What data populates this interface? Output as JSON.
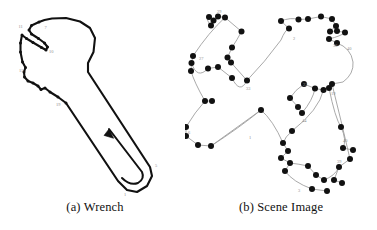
{
  "figure": {
    "background_color": "#ffffff",
    "ink_color": "#111111",
    "label_color": "#8d8d8d",
    "curve_color": "#9a9a9a",
    "panels": [
      {
        "id": "wrench",
        "caption": "(a) Wrench",
        "description": "Closed contour outline of an open-end wrench with numbered boundary feature points and a direction arrow along the handle."
      },
      {
        "id": "scene",
        "caption": "(b) Scene Image",
        "description": "Scene with many extracted interest points drawn as filled black dots linked by thin grey contour curves."
      }
    ]
  },
  "wrench": {
    "caption": "(a) Wrench",
    "outline_color": "#111111",
    "outline_width": 2.1,
    "arrow": {
      "name": "direction-arrow",
      "description": "upward arrow along inner handle edge"
    },
    "labels": [
      {
        "text": "11",
        "x": 18.5,
        "y": 27.5
      },
      {
        "text": "7",
        "x": 44.5,
        "y": 29.0
      },
      {
        "text": "10",
        "x": 49.0,
        "y": 53.0
      },
      {
        "text": "15",
        "x": 19.0,
        "y": 71.5
      },
      {
        "text": "19",
        "x": 56.0,
        "y": 106.0
      },
      {
        "text": "5",
        "x": 155.0,
        "y": 167.0
      },
      {
        "text": "1",
        "x": 124.0,
        "y": 196.0
      }
    ],
    "vertices": [
      {
        "x": 39.0,
        "y": 22.0
      },
      {
        "x": 31.5,
        "y": 25.5
      },
      {
        "x": 29.0,
        "y": 30.0
      },
      {
        "x": 31.5,
        "y": 34.0
      },
      {
        "x": 38.5,
        "y": 38.5
      },
      {
        "x": 44.5,
        "y": 43.0
      },
      {
        "x": 47.5,
        "y": 47.0
      },
      {
        "x": 46.0,
        "y": 50.0
      },
      {
        "x": 41.5,
        "y": 47.5
      },
      {
        "x": 33.0,
        "y": 42.5
      },
      {
        "x": 26.5,
        "y": 38.5
      },
      {
        "x": 22.0,
        "y": 35.0
      },
      {
        "x": 20.5,
        "y": 43.0
      },
      {
        "x": 20.5,
        "y": 52.0
      },
      {
        "x": 22.5,
        "y": 62.0
      },
      {
        "x": 25.5,
        "y": 67.5
      },
      {
        "x": 24.0,
        "y": 72.0
      },
      {
        "x": 24.5,
        "y": 77.0
      },
      {
        "x": 28.0,
        "y": 81.0
      },
      {
        "x": 33.0,
        "y": 83.0
      },
      {
        "x": 38.0,
        "y": 86.0
      },
      {
        "x": 41.0,
        "y": 89.5
      },
      {
        "x": 45.0,
        "y": 88.0
      },
      {
        "x": 50.0,
        "y": 92.0
      },
      {
        "x": 58.0,
        "y": 97.0
      },
      {
        "x": 66.0,
        "y": 103.0
      },
      {
        "x": 118.0,
        "y": 181.0
      },
      {
        "x": 127.0,
        "y": 190.0
      },
      {
        "x": 137.0,
        "y": 192.0
      },
      {
        "x": 147.0,
        "y": 186.0
      },
      {
        "x": 152.0,
        "y": 176.0
      },
      {
        "x": 150.0,
        "y": 167.0
      },
      {
        "x": 88.0,
        "y": 72.0
      },
      {
        "x": 88.0,
        "y": 63.0
      },
      {
        "x": 93.5,
        "y": 52.0
      },
      {
        "x": 95.0,
        "y": 38.0
      },
      {
        "x": 90.0,
        "y": 28.0
      },
      {
        "x": 80.0,
        "y": 21.5
      },
      {
        "x": 66.0,
        "y": 18.0
      },
      {
        "x": 52.0,
        "y": 18.5
      },
      {
        "x": 44.5,
        "y": 20.0
      }
    ]
  },
  "scene": {
    "caption": "(b) Scene Image",
    "dot_color": "#111111",
    "curve_color": "#9a9a9a",
    "dot_radius": 3.0,
    "labels": [
      {
        "text": "29",
        "x": 32.0,
        "y": 13.0
      },
      {
        "text": "27",
        "x": 14.0,
        "y": 60.0
      },
      {
        "text": "33",
        "x": 61.0,
        "y": 90.0
      },
      {
        "text": "6",
        "x": 3.0,
        "y": 134.0
      },
      {
        "text": "1",
        "x": 64.0,
        "y": 139.0
      },
      {
        "text": "2",
        "x": 108.0,
        "y": 40.0
      },
      {
        "text": "36",
        "x": 148.0,
        "y": 47.0
      },
      {
        "text": "40",
        "x": 162.0,
        "y": 50.0
      },
      {
        "text": "22",
        "x": 118.0,
        "y": 86.0
      },
      {
        "text": "19",
        "x": 146.0,
        "y": 95.0
      },
      {
        "text": "44",
        "x": 117.0,
        "y": 122.0
      },
      {
        "text": "40",
        "x": 158.0,
        "y": 142.0
      },
      {
        "text": "39",
        "x": 152.0,
        "y": 163.0
      },
      {
        "text": "3",
        "x": 113.0,
        "y": 192.0
      }
    ],
    "points": [
      {
        "x": 24.0,
        "y": 17.0
      },
      {
        "x": 28.5,
        "y": 20.5
      },
      {
        "x": 26.0,
        "y": 25.5
      },
      {
        "x": 33.0,
        "y": 16.5
      },
      {
        "x": 40.0,
        "y": 17.5
      },
      {
        "x": 56.5,
        "y": 31.5
      },
      {
        "x": 47.0,
        "y": 47.5
      },
      {
        "x": 42.5,
        "y": 57.5
      },
      {
        "x": 46.0,
        "y": 62.5
      },
      {
        "x": 62.0,
        "y": 80.5
      },
      {
        "x": 8.0,
        "y": 56.0
      },
      {
        "x": 6.5,
        "y": 63.0
      },
      {
        "x": 6.0,
        "y": 71.0
      },
      {
        "x": 23.0,
        "y": 68.5
      },
      {
        "x": 33.0,
        "y": 67.0
      },
      {
        "x": 47.0,
        "y": 78.0
      },
      {
        "x": 20.0,
        "y": 101.0
      },
      {
        "x": 27.0,
        "y": 101.0
      },
      {
        "x": 1.0,
        "y": 127.0
      },
      {
        "x": 1.0,
        "y": 136.0
      },
      {
        "x": 13.0,
        "y": 145.0
      },
      {
        "x": 26.0,
        "y": 146.0
      },
      {
        "x": 76.0,
        "y": 110.0
      },
      {
        "x": 96.0,
        "y": 21.0
      },
      {
        "x": 104.0,
        "y": 28.5
      },
      {
        "x": 113.5,
        "y": 19.5
      },
      {
        "x": 123.0,
        "y": 19.0
      },
      {
        "x": 136.0,
        "y": 16.5
      },
      {
        "x": 147.0,
        "y": 19.0
      },
      {
        "x": 151.0,
        "y": 26.0
      },
      {
        "x": 145.0,
        "y": 31.5
      },
      {
        "x": 152.0,
        "y": 31.0
      },
      {
        "x": 160.0,
        "y": 32.5
      },
      {
        "x": 144.0,
        "y": 39.0
      },
      {
        "x": 152.0,
        "y": 43.0
      },
      {
        "x": 119.0,
        "y": 84.0
      },
      {
        "x": 130.0,
        "y": 88.5
      },
      {
        "x": 138.5,
        "y": 90.0
      },
      {
        "x": 144.0,
        "y": 88.0
      },
      {
        "x": 147.0,
        "y": 84.0
      },
      {
        "x": 105.0,
        "y": 98.0
      },
      {
        "x": 113.0,
        "y": 107.0
      },
      {
        "x": 117.0,
        "y": 113.0
      },
      {
        "x": 107.0,
        "y": 131.0
      },
      {
        "x": 98.0,
        "y": 143.0
      },
      {
        "x": 103.0,
        "y": 151.0
      },
      {
        "x": 96.0,
        "y": 158.0
      },
      {
        "x": 105.0,
        "y": 163.0
      },
      {
        "x": 100.0,
        "y": 171.0
      },
      {
        "x": 123.0,
        "y": 166.0
      },
      {
        "x": 131.0,
        "y": 175.0
      },
      {
        "x": 139.0,
        "y": 180.0
      },
      {
        "x": 127.0,
        "y": 189.0
      },
      {
        "x": 142.0,
        "y": 191.0
      },
      {
        "x": 156.0,
        "y": 127.0
      },
      {
        "x": 158.0,
        "y": 148.0
      },
      {
        "x": 168.0,
        "y": 150.0
      },
      {
        "x": 165.0,
        "y": 159.0
      },
      {
        "x": 154.0,
        "y": 167.0
      },
      {
        "x": 149.0,
        "y": 180.0
      },
      {
        "x": 157.0,
        "y": 183.0
      }
    ]
  }
}
